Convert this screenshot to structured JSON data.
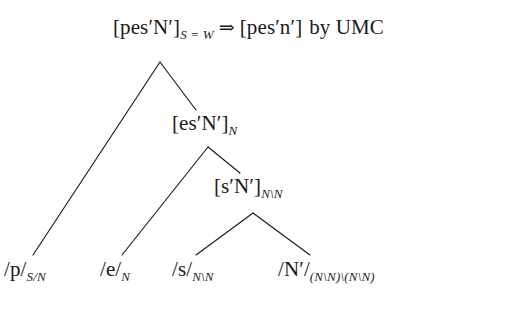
{
  "diagram": {
    "type": "categorial-grammar-derivation-tree",
    "background_color": "#ffffff",
    "ink_color": "#1a1a1a"
  },
  "root": {
    "form": "[pes′N′]",
    "subscript": "S = W",
    "arrow": "⇒",
    "output": "[pes′n′]",
    "rule_text": "by UMC"
  },
  "nodes": {
    "level2": {
      "form": "[es′N′]",
      "subscript": "N"
    },
    "level3": {
      "form": "[s′N′]",
      "subscript": "N\\N"
    }
  },
  "leaves": [
    {
      "form": "/p/",
      "subscript": "S/N"
    },
    {
      "form": "/e/",
      "subscript": "N"
    },
    {
      "form": "/s/",
      "subscript": "N\\N"
    },
    {
      "form": "/N′/",
      "subscript": "(N\\N)\\(N\\N)"
    }
  ],
  "edges": {
    "description": "binary right-branching tree",
    "lines": [
      {
        "from": "root-apex",
        "to": "leaf-p"
      },
      {
        "from": "root-apex",
        "to": "level2"
      },
      {
        "from": "level2-apex",
        "to": "leaf-e"
      },
      {
        "from": "level2-apex",
        "to": "level3"
      },
      {
        "from": "level3-apex",
        "to": "leaf-s"
      },
      {
        "from": "level3-apex",
        "to": "leaf-n"
      }
    ]
  }
}
